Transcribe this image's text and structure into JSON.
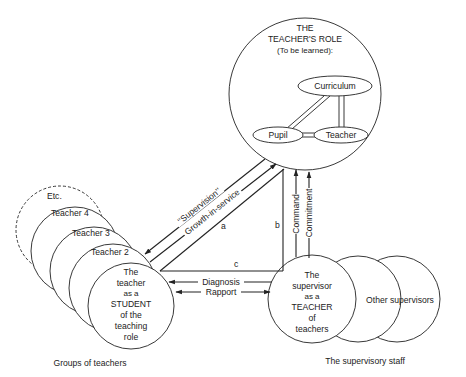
{
  "role_circle": {
    "title_lines": [
      "THE",
      "TEACHER'S ROLE",
      "(To be learned):"
    ],
    "nodes": {
      "curriculum": "Curriculum",
      "pupil": "Pupil",
      "teacher": "Teacher"
    }
  },
  "teacher_group": {
    "stack_labels": [
      "Etc.",
      "Teacher 4",
      "Teacher 3",
      "Teacher 2"
    ],
    "main_lines": [
      "The",
      "teacher",
      "as a",
      "STUDENT",
      "of the",
      "teaching",
      "role"
    ],
    "caption": "Groups of teachers"
  },
  "supervisor_group": {
    "main_lines": [
      "The",
      "supervisor",
      "as a",
      "TEACHER",
      "of",
      "teachers"
    ],
    "other_label": "Other supervisors",
    "caption": "The supervisory staff"
  },
  "connectors": {
    "supervision": "‘‘Supervision’’",
    "growth": "Growth-in-service",
    "a": "a",
    "b": "b",
    "c": "c",
    "diagnosis": "Diagnosis",
    "rapport": "Rapport",
    "command": "Command",
    "commitment": "Commitment"
  },
  "colors": {
    "ink": "#222222",
    "paper": "#ffffff"
  }
}
